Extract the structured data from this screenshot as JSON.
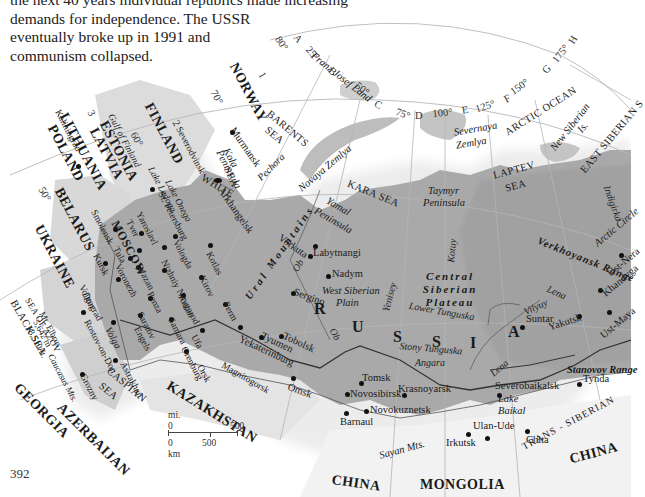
{
  "intro_text": {
    "lines": [
      "the next 40 years individual republics made increasing",
      "demands for independence. The USSR",
      "eventually broke up in 1991 and",
      "communism collapsed."
    ]
  },
  "map": {
    "title": "Russia and neighbouring states",
    "colors": {
      "russia_land": "#a6a6a6",
      "neighbour_land": "#d9d9d9",
      "sea": "#ffffff",
      "coast_shadow": "#e6e6e6",
      "grid_lines": "#b5b5b5",
      "railway": "#3a3a3a"
    },
    "main_label": [
      "R",
      "U",
      "S",
      "S",
      "I",
      "A"
    ],
    "countries": [
      {
        "id": "norway",
        "label": "NORWAY"
      },
      {
        "id": "finland",
        "label": "FINLAND"
      },
      {
        "id": "estonia",
        "label": "ESTONIA"
      },
      {
        "id": "latvia",
        "label": "LATVIA"
      },
      {
        "id": "lithuania",
        "label": "LITHUANIA"
      },
      {
        "id": "poland",
        "label": "POLAND"
      },
      {
        "id": "belarus",
        "label": "BELARUS"
      },
      {
        "id": "ukraine",
        "label": "UKRAINE"
      },
      {
        "id": "georgia",
        "label": "GEORGIA"
      },
      {
        "id": "azerbaijan",
        "label": "AZERBAIJAN"
      },
      {
        "id": "kazakhstan",
        "label": "KAZAKHSTAN"
      },
      {
        "id": "china_west",
        "label": "CHINA"
      },
      {
        "id": "mongolia",
        "label": "MONGOLIA"
      },
      {
        "id": "china_east",
        "label": "CHINA"
      }
    ],
    "seas": [
      {
        "id": "barents",
        "line1": "BARENTS",
        "line2": "SEA"
      },
      {
        "id": "kara",
        "label": "KARA SEA"
      },
      {
        "id": "laptev",
        "line1": "LAPTEV",
        "line2": "SEA"
      },
      {
        "id": "arctic",
        "label": "ARCTIC OCEAN"
      },
      {
        "id": "east_siberian",
        "label": "EAST SIBERIAN S"
      },
      {
        "id": "white",
        "label": "WHITE"
      },
      {
        "id": "white_sea",
        "label": "SEA"
      },
      {
        "id": "black",
        "label": "BLACK SEA"
      },
      {
        "id": "azov",
        "label": "SEA OF AZOV"
      },
      {
        "id": "caspian",
        "line1": "CASPIAN",
        "line2": "SEA"
      },
      {
        "id": "gulf_finland",
        "label": "Gulf of Finland"
      }
    ],
    "features": [
      {
        "id": "franz_josef",
        "label": "Franz Josef Land"
      },
      {
        "id": "novaya_zemlya",
        "label": "Novaya Zemlya"
      },
      {
        "id": "severnaya_1",
        "label": "Severnaya"
      },
      {
        "id": "severnaya_2",
        "label": "Zemlya"
      },
      {
        "id": "new_siberian_1",
        "label": "New Siberian"
      },
      {
        "id": "new_siberian_2",
        "label": "Is."
      },
      {
        "id": "kola_1",
        "label": "Kola"
      },
      {
        "id": "kola_2",
        "label": "Peninsula"
      },
      {
        "id": "yamal_1",
        "label": "Yamal"
      },
      {
        "id": "yamal_2",
        "label": "Peninsula"
      },
      {
        "id": "taymyr_1",
        "label": "Taymyr"
      },
      {
        "id": "taymyr_2",
        "label": "Peninsula"
      },
      {
        "id": "ural",
        "label": "Ural Mountains"
      },
      {
        "id": "wsp_1",
        "label": "West Siberian"
      },
      {
        "id": "wsp_2",
        "label": "Plain"
      },
      {
        "id": "csp",
        "lines": [
          "Central",
          "Siberian",
          "Plateau"
        ]
      },
      {
        "id": "verkhoyansk",
        "label": "Verkhoyansk Range"
      },
      {
        "id": "stanovoy",
        "label": "Stanovoy Range"
      },
      {
        "id": "sayan",
        "label": "Sayan Mts."
      },
      {
        "id": "lake_baikal_1",
        "label": "Lake"
      },
      {
        "id": "lake_baikal_2",
        "label": "Baikal"
      },
      {
        "id": "lake_ladoga",
        "label": "Lake Ladoga"
      },
      {
        "id": "lake_onega",
        "label": "Lake Onega"
      },
      {
        "id": "elbrus_1",
        "label": "Mt. Elbrus"
      },
      {
        "id": "elbrus_2",
        "label": "5,642 m"
      },
      {
        "id": "elbrus_3",
        "label": "18,510 ft."
      },
      {
        "id": "caucasus",
        "label": "Caucasus Mts."
      },
      {
        "id": "arctic_circle",
        "label": "Arctic Circle"
      },
      {
        "id": "trans_siberian",
        "label": "TRANS - SIBERIAN"
      }
    ],
    "rivers": [
      {
        "id": "pechora",
        "label": "Pechora"
      },
      {
        "id": "ob_n",
        "label": "Ob"
      },
      {
        "id": "ob_s",
        "label": "Ob"
      },
      {
        "id": "yenisey",
        "label": "Yenisey"
      },
      {
        "id": "kotuy",
        "label": "Kotuy"
      },
      {
        "id": "lower_tunguska",
        "label": "Lower Tunguska"
      },
      {
        "id": "stony_tunguska",
        "label": "Stony Tunguska"
      },
      {
        "id": "angara",
        "label": "Angara"
      },
      {
        "id": "lena_n",
        "label": "Lena"
      },
      {
        "id": "lena_s",
        "label": "Lena"
      },
      {
        "id": "vilyuy",
        "label": "Vilyuy"
      },
      {
        "id": "indigirka",
        "label": "Indigirka"
      },
      {
        "id": "don",
        "label": "Don"
      },
      {
        "id": "volga",
        "label": "Volga"
      }
    ],
    "cities": [
      {
        "id": "murmansk",
        "label": "Murmansk"
      },
      {
        "id": "arkhangelsk",
        "label": "Arkhangelsk"
      },
      {
        "id": "severodvinsk",
        "label": "Severodvinsk"
      },
      {
        "id": "st_petersburg",
        "label": "St. Petersburg"
      },
      {
        "id": "kaliningrad",
        "label": "Kaliningrad"
      },
      {
        "id": "moscow",
        "label": "MOSCOW"
      },
      {
        "id": "smolensk",
        "label": "Smolensk"
      },
      {
        "id": "tver",
        "label": "Tver"
      },
      {
        "id": "yaroslavl",
        "label": "Yaroslavl"
      },
      {
        "id": "vologda",
        "label": "Vologda"
      },
      {
        "id": "kotlas",
        "label": "Kotlas"
      },
      {
        "id": "kirov",
        "label": "Kirov"
      },
      {
        "id": "nizhniy",
        "label": "Nizhniy Novgorod"
      },
      {
        "id": "tula",
        "label": "Tula"
      },
      {
        "id": "kursk",
        "label": "Kursk"
      },
      {
        "id": "voronezh",
        "label": "Voronezh"
      },
      {
        "id": "ryazan",
        "label": "Ryazan"
      },
      {
        "id": "penza",
        "label": "Penza"
      },
      {
        "id": "kazan",
        "label": "Kazan"
      },
      {
        "id": "saratov",
        "label": "Saratov"
      },
      {
        "id": "samara",
        "label": "Samara"
      },
      {
        "id": "engels",
        "label": "Engels"
      },
      {
        "id": "ufa",
        "label": "Ufa"
      },
      {
        "id": "perm",
        "label": "Perm"
      },
      {
        "id": "orenburg",
        "label": "Orenburg"
      },
      {
        "id": "orsk",
        "label": "Orsk"
      },
      {
        "id": "magnitogorsk",
        "label": "Magnitogorsk"
      },
      {
        "id": "volgograd",
        "label": "Volgograd"
      },
      {
        "id": "rostov",
        "label": "Rostov-on-Don"
      },
      {
        "id": "astrakhan",
        "label": "Astrakhan"
      },
      {
        "id": "grozny",
        "label": "Grozny"
      },
      {
        "id": "vorkuta",
        "label": "Vorkuta"
      },
      {
        "id": "labytnangi",
        "label": "Labytnangi"
      },
      {
        "id": "nadym",
        "label": "Nadym"
      },
      {
        "id": "sergino",
        "label": "Sergino"
      },
      {
        "id": "tobolsk",
        "label": "Tobolsk"
      },
      {
        "id": "tyumen",
        "label": "Tyumen"
      },
      {
        "id": "yekaterinburg",
        "label": "Yekaterinburg"
      },
      {
        "id": "omsk",
        "label": "Omsk"
      },
      {
        "id": "tomsk",
        "label": "Tomsk"
      },
      {
        "id": "novosibirsk",
        "label": "Novosibirsk"
      },
      {
        "id": "novokuznetsk",
        "label": "Novokuznetsk"
      },
      {
        "id": "barnaul",
        "label": "Barnaul"
      },
      {
        "id": "krasnoyarsk",
        "label": "Krasnoyarsk"
      },
      {
        "id": "irkutsk",
        "label": "Irkutsk"
      },
      {
        "id": "ulan_ude",
        "label": "Ulan-Ude"
      },
      {
        "id": "chita",
        "label": "Chita"
      },
      {
        "id": "severobaikalsk",
        "label": "Severobaikalsk"
      },
      {
        "id": "tynda",
        "label": "Tynda"
      },
      {
        "id": "suntar",
        "label": "Suntar"
      },
      {
        "id": "yakutsk",
        "label": "Yakutsk"
      },
      {
        "id": "khandyga",
        "label": "Khandyga"
      },
      {
        "id": "ust_maya",
        "label": "Ust-Maya"
      },
      {
        "id": "ust_nera",
        "label": "Ust-Nera"
      }
    ],
    "grid": {
      "arc_labels": [
        {
          "id": "lat80",
          "label": "80°"
        },
        {
          "id": "colA",
          "label": "A"
        },
        {
          "id": "lon25",
          "label": "25°"
        },
        {
          "id": "colB",
          "label": "B"
        },
        {
          "id": "lon50",
          "label": "50°"
        },
        {
          "id": "colC",
          "label": "C"
        },
        {
          "id": "lon75",
          "label": "75°"
        },
        {
          "id": "colD",
          "label": "D"
        },
        {
          "id": "lon100",
          "label": "100°"
        },
        {
          "id": "colE",
          "label": "E"
        },
        {
          "id": "lon125",
          "label": "125°"
        },
        {
          "id": "colF",
          "label": "F"
        },
        {
          "id": "lon150",
          "label": "150°"
        },
        {
          "id": "colG",
          "label": "G"
        },
        {
          "id": "lon175",
          "label": "175°"
        },
        {
          "id": "colH",
          "label": "H"
        }
      ],
      "row_labels": [
        {
          "id": "row1",
          "label": "1"
        },
        {
          "id": "row2",
          "label": "2"
        },
        {
          "id": "row3",
          "label": "3"
        }
      ],
      "lat_labels": [
        {
          "id": "lat70",
          "label": "70°"
        },
        {
          "id": "lat60",
          "label": "60°"
        },
        {
          "id": "lat50",
          "label": "50°"
        }
      ]
    },
    "scale_bar": {
      "mi_unit": "mi.",
      "mi_zero": "0",
      "mi_max": "500",
      "km_zero": "0",
      "km_mid": "500",
      "km_unit": "km"
    }
  },
  "page_number": "392"
}
